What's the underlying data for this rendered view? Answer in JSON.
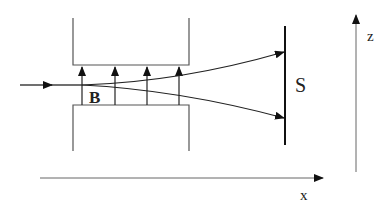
{
  "diagram": {
    "type": "physics-schematic",
    "labels": {
      "field": "B",
      "screen": "S",
      "x_axis": "x",
      "z_axis": "z"
    },
    "field_arrows_count": 4,
    "colors": {
      "line": "#222222",
      "magnet_outline": "#555555",
      "background": "#ffffff"
    }
  }
}
